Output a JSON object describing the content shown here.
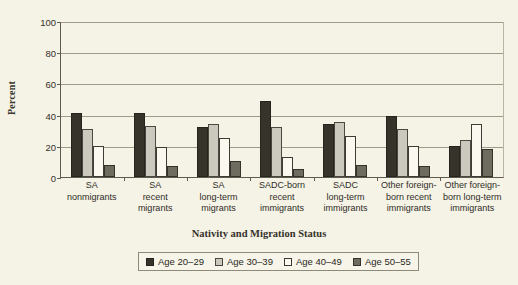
{
  "chart_data": {
    "type": "bar",
    "title": "",
    "xlabel": "Nativity and Migration Status",
    "ylabel": "Percent",
    "ylim": [
      0,
      100
    ],
    "yticks": [
      0,
      20,
      40,
      60,
      80,
      100
    ],
    "grid": true,
    "legend_position": "bottom",
    "categories": [
      "SA\nnonmigrants",
      "SA\nrecent\nmigrants",
      "SA\nlong-term\nmigrants",
      "SADC-born\nrecent\nimmigrants",
      "SADC\nlong-term\nimmigrants",
      "Other foreign-\nborn recent\nimmigrants",
      "Other foreign-\nborn long-term\nimmigrants"
    ],
    "category_lines": [
      [
        "SA",
        "nonmigrants"
      ],
      [
        "SA",
        "recent",
        "migrants"
      ],
      [
        "SA",
        "long-term",
        "migrants"
      ],
      [
        "SADC-born",
        "recent",
        "immigrants"
      ],
      [
        "SADC",
        "long-term",
        "immigrants"
      ],
      [
        "Other foreign-",
        "born recent",
        "immigrants"
      ],
      [
        "Other foreign-",
        "born long-term",
        "immigrants"
      ]
    ],
    "series": [
      {
        "name": "Age 20–29",
        "color": "#36332b",
        "values": [
          41,
          41,
          32,
          49,
          34,
          39,
          20
        ]
      },
      {
        "name": "Age 30–39",
        "color": "#cbc9bd",
        "values": [
          31,
          33,
          34,
          32,
          35,
          31,
          24
        ]
      },
      {
        "name": "Age 40–49",
        "color": "#fbf9ef",
        "values": [
          20,
          19,
          25,
          13,
          26,
          20,
          34
        ]
      },
      {
        "name": "Age 50–55",
        "color": "#6e6b5f",
        "values": [
          8,
          7,
          10,
          5,
          8,
          7,
          18
        ]
      }
    ]
  },
  "legend": {
    "items": [
      {
        "label": "Age 20–29"
      },
      {
        "label": "Age 30–39"
      },
      {
        "label": "Age 40–49"
      },
      {
        "label": "Age 50–55"
      }
    ]
  }
}
